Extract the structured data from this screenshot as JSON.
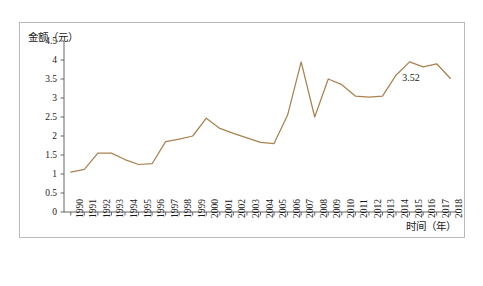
{
  "chart_data": {
    "type": "line",
    "title": "",
    "ylabel": "金额（元）",
    "xlabel": "时间（年）",
    "ylim": [
      0,
      4.5
    ],
    "yticks": [
      "0",
      "0.5",
      "1",
      "1.5",
      "2",
      "2.5",
      "3",
      "3.5",
      "4",
      "4.5"
    ],
    "ytick_values": [
      0,
      0.5,
      1,
      1.5,
      2,
      2.5,
      3,
      3.5,
      4,
      4.5
    ],
    "grid": false,
    "legend": "none",
    "line_color": "#a98250",
    "categories": [
      "1990",
      "1991",
      "1992",
      "1993",
      "1994",
      "1995",
      "1996",
      "1997",
      "1998",
      "1999",
      "2000",
      "2001",
      "2002",
      "2003",
      "2004",
      "2005",
      "2006",
      "2007",
      "2008",
      "2009",
      "2010",
      "2011",
      "2012",
      "2013",
      "2014",
      "2015",
      "2016",
      "2017",
      "2018"
    ],
    "values": [
      1.05,
      1.12,
      1.55,
      1.55,
      1.38,
      1.25,
      1.27,
      1.85,
      1.92,
      2.0,
      2.47,
      2.2,
      2.07,
      1.95,
      1.83,
      1.8,
      2.55,
      3.95,
      2.5,
      3.5,
      3.35,
      3.05,
      3.02,
      3.05,
      3.6,
      3.95,
      3.82,
      3.9,
      3.52
    ],
    "annotations": [
      {
        "label": "3.52",
        "x": "2018",
        "y": 3.52
      }
    ]
  }
}
